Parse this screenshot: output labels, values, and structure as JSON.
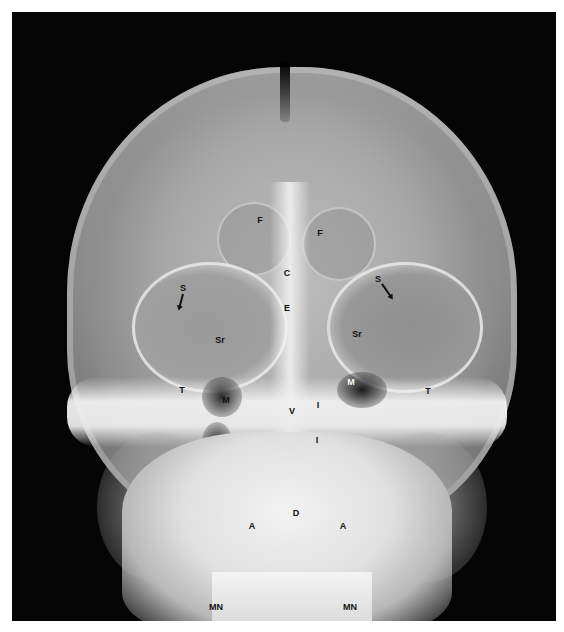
{
  "figure": {
    "labels": [
      {
        "text": "F",
        "x": 260,
        "y": 220
      },
      {
        "text": "F",
        "x": 320,
        "y": 233
      },
      {
        "text": "C",
        "x": 287,
        "y": 273
      },
      {
        "text": "E",
        "x": 287,
        "y": 308
      },
      {
        "text": "S",
        "x": 183,
        "y": 288
      },
      {
        "text": "S",
        "x": 378,
        "y": 279
      },
      {
        "text": "Sr",
        "x": 220,
        "y": 340
      },
      {
        "text": "Sr",
        "x": 357,
        "y": 334
      },
      {
        "text": "T",
        "x": 182,
        "y": 390
      },
      {
        "text": "M",
        "x": 226,
        "y": 400
      },
      {
        "text": "M",
        "x": 351,
        "y": 382
      },
      {
        "text": "T",
        "x": 428,
        "y": 391
      },
      {
        "text": "V",
        "x": 292,
        "y": 411
      },
      {
        "text": "I",
        "x": 318,
        "y": 405
      },
      {
        "text": "I",
        "x": 317,
        "y": 440
      },
      {
        "text": "D",
        "x": 296,
        "y": 513
      },
      {
        "text": "A",
        "x": 252,
        "y": 526
      },
      {
        "text": "A",
        "x": 343,
        "y": 526
      },
      {
        "text": "MN",
        "x": 216,
        "y": 607
      },
      {
        "text": "MN",
        "x": 350,
        "y": 607
      }
    ]
  }
}
